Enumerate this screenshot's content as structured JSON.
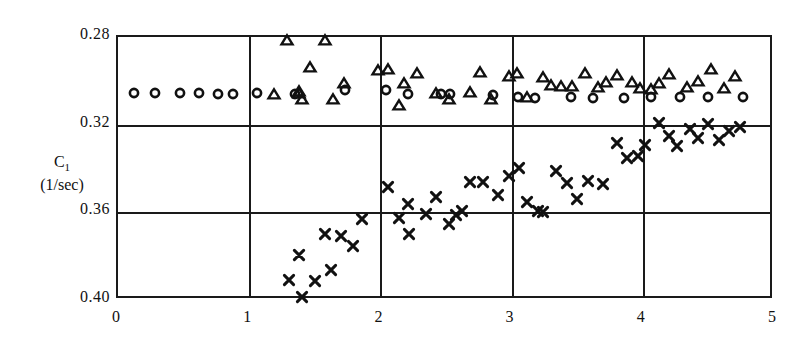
{
  "axes": {
    "y_title_line1": "C",
    "y_title_sub": "1",
    "y_title_line2": "(1/sec)",
    "y_ticks": [
      "0.28",
      "0.32",
      "0.36",
      "0.40"
    ],
    "x_ticks": [
      "0",
      "1",
      "2",
      "3",
      "4",
      "5"
    ]
  },
  "chart_data": {
    "type": "scatter",
    "title": "",
    "xlabel": "",
    "ylabel": "C1 (1/sec)",
    "xlim": [
      0,
      5
    ],
    "ylim": [
      0.28,
      0.4
    ],
    "y_axis_inverted": true,
    "grid": true,
    "legend_position": "none",
    "x_ticks": [
      0,
      1,
      2,
      3,
      4,
      5
    ],
    "y_ticks": [
      0.28,
      0.32,
      0.36,
      0.4
    ],
    "marker_colors": {
      "circle": "#111111",
      "triangle": "#111111",
      "cross": "#111111"
    },
    "series": [
      {
        "name": "circle",
        "marker": "circle",
        "points": [
          [
            0.12,
            0.3055
          ],
          [
            0.28,
            0.3055
          ],
          [
            0.47,
            0.3055
          ],
          [
            0.62,
            0.3055
          ],
          [
            0.76,
            0.3058
          ],
          [
            0.88,
            0.3058
          ],
          [
            1.06,
            0.3055
          ],
          [
            1.35,
            0.3058
          ],
          [
            1.73,
            0.304
          ],
          [
            2.04,
            0.3042
          ],
          [
            2.21,
            0.306
          ],
          [
            2.46,
            0.3062
          ],
          [
            2.53,
            0.3062
          ],
          [
            2.86,
            0.3065
          ],
          [
            3.05,
            0.3072
          ],
          [
            3.18,
            0.3078
          ],
          [
            3.45,
            0.3072
          ],
          [
            3.62,
            0.3078
          ],
          [
            3.86,
            0.3078
          ],
          [
            4.06,
            0.3075
          ],
          [
            4.28,
            0.3072
          ],
          [
            4.5,
            0.3072
          ],
          [
            4.76,
            0.3072
          ]
        ]
      },
      {
        "name": "triangle",
        "marker": "triangle",
        "points": [
          [
            1.29,
            0.2812
          ],
          [
            1.58,
            0.2812
          ],
          [
            1.46,
            0.2935
          ],
          [
            1.19,
            0.3062
          ],
          [
            1.38,
            0.3055
          ],
          [
            1.4,
            0.3085
          ],
          [
            1.38,
            0.3048
          ],
          [
            1.64,
            0.3085
          ],
          [
            1.72,
            0.3012
          ],
          [
            1.98,
            0.295
          ],
          [
            2.06,
            0.2945
          ],
          [
            2.18,
            0.3012
          ],
          [
            2.28,
            0.2962
          ],
          [
            2.14,
            0.3108
          ],
          [
            2.42,
            0.3055
          ],
          [
            2.52,
            0.3085
          ],
          [
            2.68,
            0.305
          ],
          [
            2.76,
            0.296
          ],
          [
            2.84,
            0.3085
          ],
          [
            2.98,
            0.298
          ],
          [
            3.04,
            0.2962
          ],
          [
            3.12,
            0.3075
          ],
          [
            3.24,
            0.2982
          ],
          [
            3.3,
            0.302
          ],
          [
            3.38,
            0.3022
          ],
          [
            3.46,
            0.3022
          ],
          [
            3.56,
            0.2965
          ],
          [
            3.66,
            0.303
          ],
          [
            3.72,
            0.3005
          ],
          [
            3.8,
            0.2975
          ],
          [
            3.92,
            0.3005
          ],
          [
            3.98,
            0.3032
          ],
          [
            4.06,
            0.3035
          ],
          [
            4.12,
            0.3008
          ],
          [
            4.2,
            0.2968
          ],
          [
            4.34,
            0.303
          ],
          [
            4.42,
            0.3
          ],
          [
            4.52,
            0.2945
          ],
          [
            4.62,
            0.3032
          ],
          [
            4.7,
            0.298
          ]
        ]
      },
      {
        "name": "cross",
        "marker": "cross",
        "points": [
          [
            1.3,
            0.3908
          ],
          [
            1.38,
            0.3795
          ],
          [
            1.4,
            0.3988
          ],
          [
            1.5,
            0.3912
          ],
          [
            1.58,
            0.37
          ],
          [
            1.62,
            0.3862
          ],
          [
            1.7,
            0.3708
          ],
          [
            1.79,
            0.3755
          ],
          [
            1.86,
            0.363
          ],
          [
            2.06,
            0.3485
          ],
          [
            2.14,
            0.3625
          ],
          [
            2.21,
            0.356
          ],
          [
            2.22,
            0.37
          ],
          [
            2.35,
            0.3608
          ],
          [
            2.42,
            0.353
          ],
          [
            2.52,
            0.3655
          ],
          [
            2.58,
            0.3612
          ],
          [
            2.62,
            0.3592
          ],
          [
            2.68,
            0.346
          ],
          [
            2.78,
            0.346
          ],
          [
            2.9,
            0.352
          ],
          [
            2.98,
            0.3432
          ],
          [
            3.06,
            0.3398
          ],
          [
            3.12,
            0.3552
          ],
          [
            3.2,
            0.3595
          ],
          [
            3.24,
            0.3598
          ],
          [
            3.34,
            0.3412
          ],
          [
            3.42,
            0.3468
          ],
          [
            3.5,
            0.3538
          ],
          [
            3.58,
            0.3455
          ],
          [
            3.7,
            0.3472
          ],
          [
            3.8,
            0.3282
          ],
          [
            3.88,
            0.3352
          ],
          [
            3.96,
            0.3345
          ],
          [
            4.02,
            0.3292
          ],
          [
            4.12,
            0.3192
          ],
          [
            4.2,
            0.3252
          ],
          [
            4.26,
            0.3298
          ],
          [
            4.36,
            0.3222
          ],
          [
            4.42,
            0.3262
          ],
          [
            4.5,
            0.3198
          ],
          [
            4.58,
            0.3272
          ],
          [
            4.66,
            0.3228
          ],
          [
            4.74,
            0.3212
          ]
        ]
      }
    ]
  }
}
